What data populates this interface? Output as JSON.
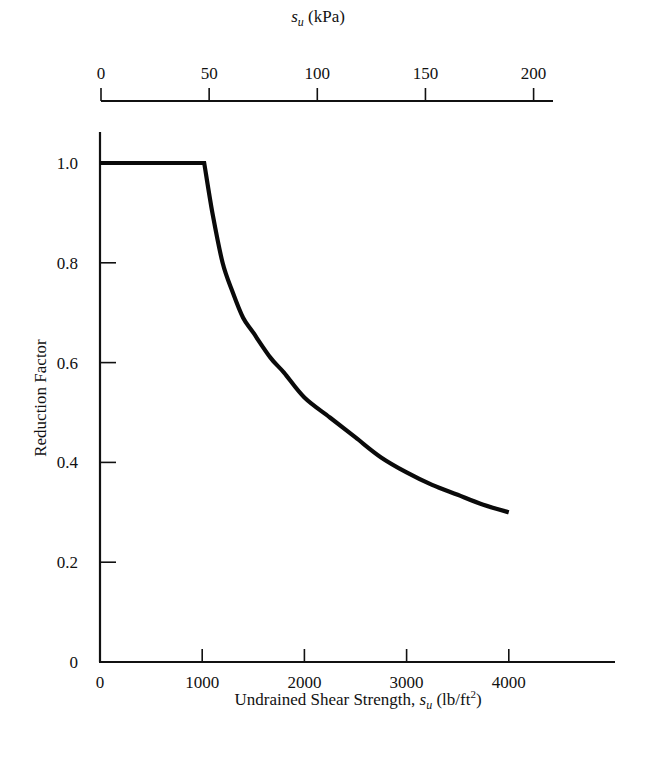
{
  "chart_data": {
    "type": "line",
    "title": "",
    "xlabel": "Undrained Shear Strength, s_u (lb/ft²)",
    "xlabel_parts": {
      "prefix": "Undrained Shear Strength, ",
      "var": "s",
      "sub": "u",
      "unit_open": " (lb/ft",
      "sup": "2",
      "unit_close": ")"
    },
    "ylabel": "Reduction Factor",
    "x_ticks": [
      0,
      1000,
      2000,
      3000,
      4000
    ],
    "y_ticks": [
      0,
      0.2,
      0.4,
      0.6,
      0.8,
      1.0
    ],
    "y_tick_labels": [
      "0",
      "0.2",
      "0.4",
      "0.6",
      "0.8",
      "1.0"
    ],
    "xlim": [
      0,
      5050
    ],
    "ylim": [
      0,
      1.06
    ],
    "secondary_x_axis": {
      "label": "s_u (kPa)",
      "label_parts": {
        "var": "s",
        "sub": "u",
        "unit": " (kPa)"
      },
      "ticks": [
        0,
        50,
        100,
        150,
        200
      ],
      "position": "top"
    },
    "grid": false,
    "legend": null,
    "series": [
      {
        "name": "Reduction Factor",
        "x": [
          0,
          1000,
          1020,
          1100,
          1200,
          1300,
          1400,
          1500,
          1667,
          1800,
          2000,
          2250,
          2500,
          2750,
          3000,
          3250,
          3500,
          3750,
          4000
        ],
        "y": [
          1.0,
          1.0,
          1.0,
          0.9,
          0.8,
          0.74,
          0.69,
          0.66,
          0.61,
          0.58,
          0.53,
          0.49,
          0.45,
          0.41,
          0.38,
          0.355,
          0.335,
          0.315,
          0.3
        ]
      }
    ]
  }
}
